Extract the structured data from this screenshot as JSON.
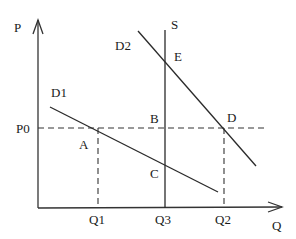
{
  "axes": {
    "y_label": "P",
    "x_label": "Q"
  },
  "price_levels": {
    "p0": "P0"
  },
  "quantity_labels": {
    "q1": "Q1",
    "q3": "Q3",
    "q2": "Q2"
  },
  "curves": {
    "d1": "D1",
    "d2": "D2",
    "s": "S"
  },
  "points": {
    "a": "A",
    "b": "B",
    "c": "C",
    "d": "D",
    "e": "E"
  },
  "colors": {
    "line": "#2a2a2a",
    "background": "#ffffff"
  }
}
